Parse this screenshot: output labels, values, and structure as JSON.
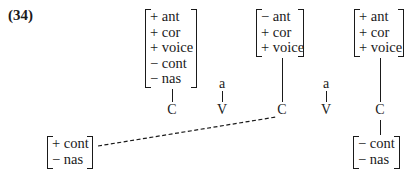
{
  "example_number": "(34)",
  "matrices": {
    "m1": {
      "rows": [
        "+ ant",
        "+ cor",
        "+ voice",
        "− cont",
        "− nas"
      ]
    },
    "m2": {
      "rows": [
        "− ant",
        "+ cor",
        "+ voice"
      ]
    },
    "m3": {
      "rows": [
        "+ ant",
        "+ cor",
        "+ voice"
      ]
    },
    "m4": {
      "rows": [
        "− cont",
        "− nas"
      ]
    },
    "m5": {
      "rows": [
        "+ cont",
        "− nas"
      ]
    }
  },
  "skeleton": {
    "slots": [
      "C",
      "V",
      "C",
      "V",
      "C"
    ],
    "melody": {
      "v1": "a",
      "v2": "a"
    }
  },
  "links": {
    "dashed": "m5 to second C"
  }
}
